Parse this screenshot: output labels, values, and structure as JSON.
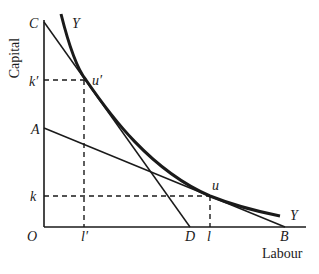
{
  "diagram": {
    "type": "isoquant-isocost",
    "axes": {
      "y_label": "Capital",
      "x_label": "Labour",
      "origin_label": "O"
    },
    "points": {
      "C": "C",
      "A": "A",
      "D": "D",
      "B": "B",
      "k_prime": "k′",
      "k": "k",
      "l_prime": "l′",
      "l": "l",
      "u_prime": "u′",
      "u": "u"
    },
    "curve_labels": {
      "isoquant_top": "Y",
      "isoquant_bottom": "Y"
    },
    "lines": [
      {
        "name": "CD",
        "from": "C",
        "to": "D",
        "tangent_at": "u′"
      },
      {
        "name": "AB",
        "from": "A",
        "to": "B",
        "tangent_at": "u"
      }
    ],
    "colors": {
      "stroke": "#1a1a1a",
      "background": "#ffffff"
    }
  }
}
